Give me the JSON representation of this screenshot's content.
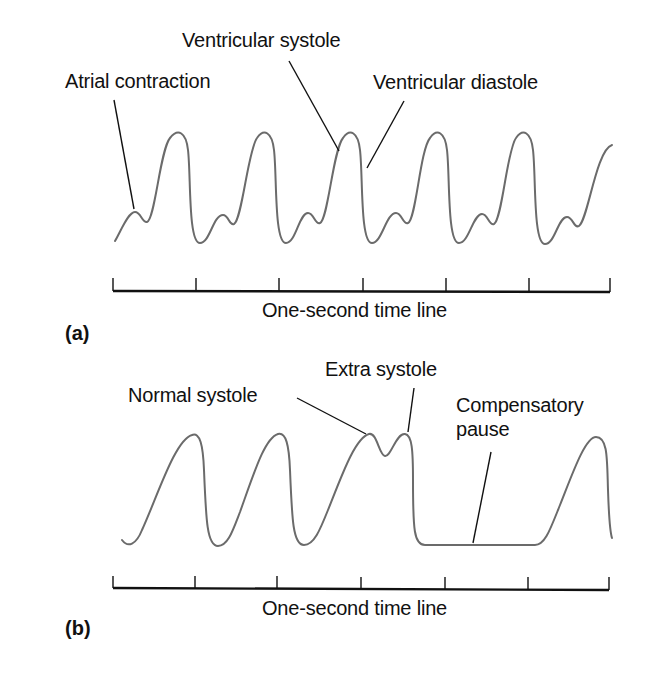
{
  "panel_a": {
    "tag": "(a)",
    "labels": {
      "atrial_contraction": "Atrial contraction",
      "ventricular_systole": "Ventricular systole",
      "ventricular_diastole": "Ventricular diastole"
    },
    "timeline_label": "One-second time line",
    "timeline": {
      "x_start": 113,
      "x_end": 610,
      "y": 291,
      "ticks_x": [
        113,
        196,
        279,
        363,
        446,
        529,
        610
      ]
    },
    "waveform": {
      "description": "Regular arterial pressure pulses; each cycle = small atrial bump followed by tall ventricular systole peak and diastolic fall",
      "cycles": 6,
      "peak_x": [
        178,
        264,
        350,
        437,
        523
      ],
      "atrial_bump_x": [
        135,
        223,
        308,
        396,
        482,
        567
      ]
    }
  },
  "panel_b": {
    "tag": "(b)",
    "labels": {
      "normal_systole": "Normal systole",
      "extra_systole": "Extra systole",
      "compensatory_pause_line1": "Compensatory",
      "compensatory_pause_line2": "pause"
    },
    "timeline_label": "One-second time line",
    "timeline": {
      "x_start": 113,
      "x_end": 609,
      "y": 589,
      "ticks_x": [
        113,
        195,
        277,
        361,
        445,
        528,
        609
      ]
    },
    "waveform": {
      "description": "Two normal beats, a normal systole immediately followed by an extra systole, a flat compensatory pause, then a normal beat",
      "peak_x": [
        196,
        281,
        371,
        406,
        597
      ]
    }
  },
  "colors": {
    "ink": "#111111",
    "trace": "#6b6b6b",
    "background": "#ffffff"
  }
}
